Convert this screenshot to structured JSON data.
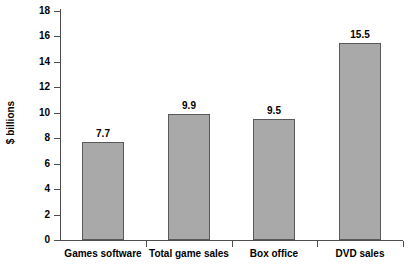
{
  "chart_data": {
    "type": "bar",
    "title": "",
    "xlabel": "",
    "ylabel": "$ billions",
    "categories": [
      "Games software",
      "Total game sales",
      "Box office",
      "DVD sales"
    ],
    "values": [
      7.7,
      9.9,
      9.5,
      15.5
    ],
    "value_labels": [
      "7.7",
      "9.9",
      "9.5",
      "15.5"
    ],
    "ylim": [
      0,
      18
    ],
    "ytick_labels": [
      "18",
      "16",
      "14",
      "12",
      "10",
      "8",
      "6",
      "4",
      "2",
      "0"
    ],
    "ytick_values": [
      18,
      16,
      14,
      12,
      10,
      8,
      6,
      4,
      2,
      0
    ],
    "grid": false,
    "legend": "none",
    "colors": {
      "bar_fill": "#a9a9a9",
      "bar_edge": "#59595b",
      "axis": "#4d4d4d",
      "text": "#000000",
      "background": "#ffffff"
    }
  }
}
